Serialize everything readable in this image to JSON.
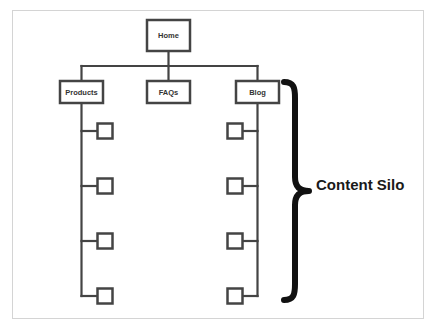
{
  "diagram": {
    "type": "site-architecture-tree",
    "colors": {
      "line": "#444444",
      "box_fill": "#ffffff",
      "brace": "#111111",
      "frame": "#d4d4d4"
    },
    "root": {
      "label": "Home",
      "x": 147,
      "y": 20,
      "w": 43,
      "h": 31
    },
    "connector_y": 66,
    "sections": [
      {
        "label": "Products",
        "x": 60,
        "y": 81,
        "w": 43,
        "h": 22,
        "children_side": "right",
        "child_count": 4
      },
      {
        "label": "FAQs",
        "x": 147,
        "y": 81,
        "w": 43,
        "h": 22,
        "children_side": "none",
        "child_count": 0
      },
      {
        "label": "Blog",
        "x": 236,
        "y": 81,
        "w": 43,
        "h": 22,
        "children_side": "left",
        "child_count": 4
      }
    ],
    "child_rows_y": [
      131,
      186,
      241,
      296
    ],
    "child_box_size": 15,
    "annotation": {
      "label": "Content Silo",
      "brace_top": 82,
      "brace_bottom": 300,
      "brace_x": 290,
      "brace_tip_x": 309
    }
  }
}
